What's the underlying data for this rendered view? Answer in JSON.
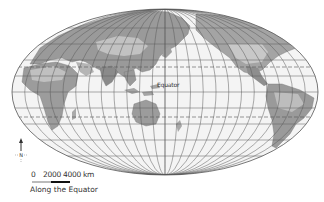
{
  "map": {
    "projection": "Mollweide (Pacific-centered)",
    "equator_label": "Equator",
    "colors": {
      "ocean": "#f4f4f4",
      "land_light": "#bdbdbd",
      "land_dark": "#8f8f8f",
      "grid": "#555555",
      "outline": "#555555"
    }
  },
  "compass": {
    "label": "N"
  },
  "scale": {
    "tick_0": "0",
    "tick_2000": "2000",
    "tick_4000": "4000 km",
    "caption": "Along the Equator"
  }
}
